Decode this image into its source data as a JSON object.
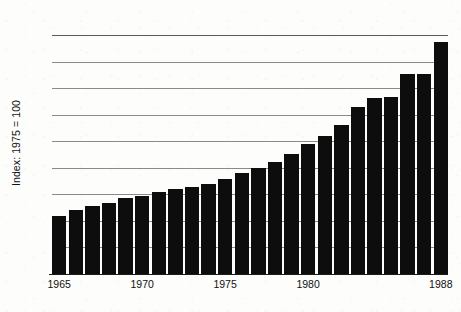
{
  "chart_data": {
    "type": "bar",
    "title": "",
    "xlabel": "",
    "ylabel": "Index: 1975 = 100",
    "ylim": [
      0,
      225
    ],
    "xlim": [
      1965,
      1988
    ],
    "grid": true,
    "legend": false,
    "bar_color": "#0d0d0d",
    "gridline_color": "#8a8a8a",
    "ytick_labels": [
      "200",
      "175",
      "150",
      "125",
      "100",
      "75",
      "50",
      "25",
      "0"
    ],
    "ytick_values": [
      200,
      175,
      150,
      125,
      100,
      75,
      50,
      25,
      0
    ],
    "xtick_labels": [
      "1965",
      "1970",
      "1975",
      "1980",
      "1988"
    ],
    "xtick_values": [
      1965,
      1970,
      1975,
      1980,
      1988
    ],
    "categories": [
      "1965",
      "1966",
      "1967",
      "1968",
      "1969",
      "1970",
      "1971",
      "1972",
      "1973",
      "1974",
      "1975",
      "1976",
      "1977",
      "1978",
      "1979",
      "1980",
      "1981",
      "1982",
      "1983",
      "1984",
      "1985",
      "1986",
      "1987",
      "1988"
    ],
    "values": [
      55,
      60,
      64,
      67,
      72,
      73,
      77,
      80,
      82,
      85,
      89,
      95,
      100,
      105,
      113,
      122,
      130,
      140,
      157,
      166,
      167,
      188,
      188,
      204
    ],
    "values_note": "final bar 1988 reaches 218",
    "values_exact": [
      55,
      60,
      64,
      67,
      72,
      73,
      77,
      80,
      82,
      85,
      89,
      95,
      100,
      105,
      113,
      122,
      130,
      140,
      157,
      166,
      167,
      188,
      188,
      218
    ]
  }
}
